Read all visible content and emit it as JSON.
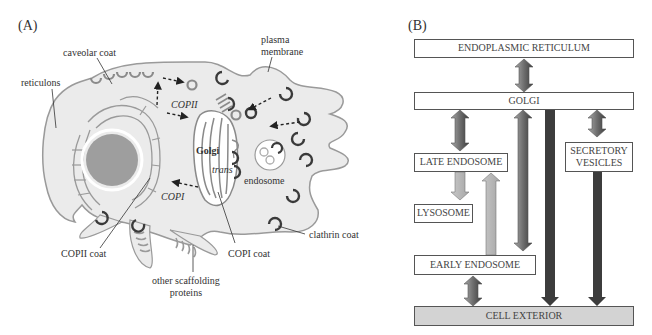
{
  "panel_a": {
    "label": "(A)",
    "callouts": {
      "caveolar_coat": "caveolar coat",
      "reticulons": "reticulons",
      "plasma_membrane_line1": "plasma",
      "plasma_membrane_line2": "membrane",
      "copii_coat": "COPII coat",
      "copi_coat": "COPI coat",
      "clathrin_coat": "clathrin coat",
      "scaffolding_line1": "other scaffolding",
      "scaffolding_line2": "proteins"
    },
    "inline_labels": {
      "copii": "COPII",
      "copi": "COPI",
      "golgi": "Golgi",
      "trans": "trans",
      "endosome": "endosome"
    },
    "colors": {
      "cytoplasm": "#ebebeb",
      "membrane": "#9a9a9a",
      "nucleus": "#9e9e9e",
      "dark_coat": "#3a3a3a",
      "light_coat": "#8a8a8a"
    }
  },
  "panel_b": {
    "label": "(B)",
    "boxes": {
      "er": "ENDOPLASMIC RETICULUM",
      "golgi": "GOLGI",
      "late_endosome": "LATE ENDOSOME",
      "secretory_line1": "SECRETORY",
      "secretory_line2": "VESICLES",
      "lysosome": "LYSOSOME",
      "early_endosome": "EARLY ENDOSOME",
      "cell_exterior": "CELL EXTERIOR"
    },
    "arrows": [
      {
        "from": "ENDOPLASMIC RETICULUM",
        "to": "GOLGI",
        "direction": "bidirectional"
      },
      {
        "from": "GOLGI",
        "to": "LATE ENDOSOME",
        "direction": "bidirectional"
      },
      {
        "from": "LATE ENDOSOME",
        "to": "LYSOSOME",
        "direction": "down"
      },
      {
        "from": "EARLY ENDOSOME",
        "to": "LATE ENDOSOME",
        "direction": "up"
      },
      {
        "from": "EARLY ENDOSOME",
        "to": "GOLGI",
        "direction": "bidirectional"
      },
      {
        "from": "GOLGI",
        "to": "CELL EXTERIOR",
        "direction": "down"
      },
      {
        "from": "GOLGI",
        "to": "SECRETORY VESICLES",
        "direction": "bidirectional"
      },
      {
        "from": "SECRETORY VESICLES",
        "to": "CELL EXTERIOR",
        "direction": "down"
      },
      {
        "from": "EARLY ENDOSOME",
        "to": "CELL EXTERIOR",
        "direction": "bidirectional"
      }
    ],
    "colors": {
      "dark_arrow": "#3c3c3c",
      "mid_arrow": "#8c8c8c",
      "light_arrow": "#b8b8b8",
      "exterior_fill": "#d3d3d3",
      "box_border": "#555555"
    }
  }
}
